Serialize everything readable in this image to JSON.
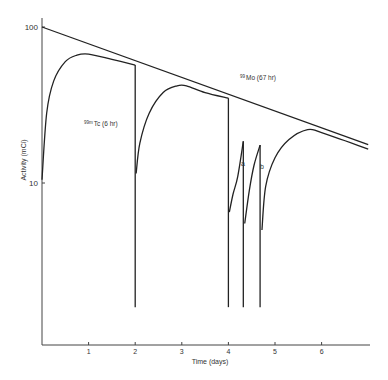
{
  "chart_data": {
    "type": "line",
    "title": "",
    "xlabel": "Time (days)",
    "ylabel": "Activity (mCi)",
    "yscale": "log",
    "xlim": [
      0,
      7
    ],
    "ylim": [
      1,
      110
    ],
    "x_ticks": [
      1,
      2,
      3,
      4,
      5,
      6
    ],
    "y_ticks": [
      10,
      100
    ],
    "grid": false,
    "annotations": [
      {
        "text": "99mTc (6 hr)",
        "sup": "99m",
        "base": "Tc (6 hr)",
        "x": 1.55,
        "y": 40
      },
      {
        "text": "99Mo (67 hr)",
        "sup": "99",
        "base": "Mo (67 hr)",
        "x": 4.6,
        "y": 56
      },
      {
        "text": "a",
        "x": 4.32,
        "y": 20
      },
      {
        "text": "b",
        "x": 4.68,
        "y": 19
      }
    ],
    "series": [
      {
        "name": "99Mo (67 hr)",
        "points": [
          [
            0,
            100
          ],
          [
            7,
            17.6
          ]
        ]
      },
      {
        "name": "99mTc (6 hr) elution 1",
        "points": [
          [
            0,
            10.5
          ],
          [
            0.1,
            28
          ],
          [
            0.25,
            45
          ],
          [
            0.5,
            60
          ],
          [
            0.75,
            66
          ],
          [
            1.0,
            67
          ],
          [
            1.5,
            62
          ],
          [
            2.0,
            57
          ]
        ]
      },
      {
        "name": "99mTc (6 hr) elution 2",
        "points": [
          [
            2.02,
            11.5
          ],
          [
            2.1,
            18
          ],
          [
            2.3,
            28
          ],
          [
            2.6,
            38
          ],
          [
            2.9,
            42
          ],
          [
            3.1,
            42
          ],
          [
            3.5,
            38
          ],
          [
            4.0,
            35
          ]
        ]
      },
      {
        "name": "99mTc elution a",
        "points": [
          [
            4.02,
            6.5
          ],
          [
            4.1,
            8.5
          ],
          [
            4.2,
            11
          ],
          [
            4.32,
            18.5
          ]
        ]
      },
      {
        "name": "99mTc elution b",
        "points": [
          [
            4.35,
            5.5
          ],
          [
            4.45,
            9
          ],
          [
            4.55,
            13
          ],
          [
            4.68,
            17.5
          ]
        ]
      },
      {
        "name": "99mTc elution 3",
        "points": [
          [
            4.72,
            5
          ],
          [
            4.8,
            9.5
          ],
          [
            5.0,
            14.5
          ],
          [
            5.3,
            19
          ],
          [
            5.7,
            22
          ],
          [
            6.0,
            21
          ],
          [
            7.0,
            16.5
          ]
        ]
      }
    ],
    "elution_drops": [
      {
        "x": 2.0,
        "from": 57,
        "to": 1.6
      },
      {
        "x": 4.0,
        "from": 35,
        "to": 1.6
      },
      {
        "x": 4.32,
        "from": 18.5,
        "to": 1.6
      },
      {
        "x": 4.68,
        "from": 17.5,
        "to": 1.6
      }
    ]
  },
  "labels": {
    "y100": "100",
    "y10": "10",
    "xticks": [
      "1",
      "2",
      "3",
      "4",
      "5",
      "6"
    ],
    "xlabel": "Time (days)",
    "ylabel": "Activity (mCi)",
    "tc_sup": "99m",
    "tc_base": "Tc (6 hr)",
    "mo_sup": "99",
    "mo_base": "Mo (67 hr)",
    "a": "a",
    "b": "b"
  }
}
